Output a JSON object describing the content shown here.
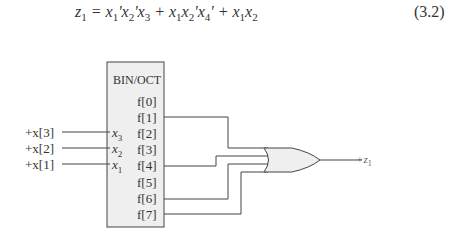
{
  "equation": {
    "lhs": "z",
    "lhs_sub": "1",
    "equals": " = ",
    "terms": [
      {
        "text": "x₁'x₂'x₃"
      },
      {
        "text": "x₁x₂'x₄'"
      },
      {
        "text": "x₁x₂"
      }
    ],
    "number": "(3.2)"
  },
  "decoder": {
    "title": "BIN/OCT",
    "inputs": [
      {
        "signal": "+x[3]",
        "pin": "x",
        "pin_sub": "3"
      },
      {
        "signal": "+x[2]",
        "pin": "x",
        "pin_sub": "2"
      },
      {
        "signal": "+x[1]",
        "pin": "x",
        "pin_sub": "1"
      }
    ],
    "outputs": [
      "f[0]",
      "f[1]",
      "f[2]",
      "f[3]",
      "f[4]",
      "f[5]",
      "f[6]",
      "f[7]"
    ]
  },
  "gate": {
    "type": "OR",
    "inputs_from": [
      "f[1]",
      "f[4]",
      "f[6]",
      "f[7]"
    ],
    "output": "+z",
    "output_sub": "1"
  },
  "colors": {
    "box_fill": "#efefef",
    "line": "#444444"
  }
}
